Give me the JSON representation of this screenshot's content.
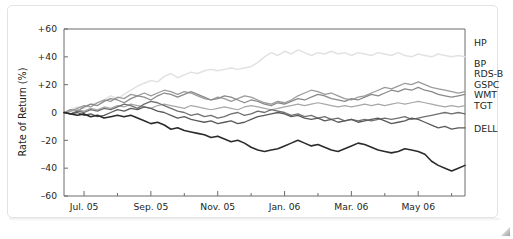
{
  "chart_data": {
    "type": "line",
    "title": "",
    "subtitle": "",
    "xlabel": "",
    "ylabel": "Rate of Return (%)",
    "ylim": [
      -60,
      60
    ],
    "yticks": [
      60,
      40,
      20,
      0,
      -20,
      -40,
      -60
    ],
    "ytick_labels": [
      "+60",
      "+40",
      "+20",
      "0",
      "–20",
      "–40",
      "–60"
    ],
    "xlim": [
      0,
      12
    ],
    "xtick_labels": [
      "Jul. 05",
      "Sep. 05",
      "Nov. 05",
      "Jan. 06",
      "Mar. 06",
      "May 06"
    ],
    "xtick_positions": [
      0.6,
      2.6,
      4.6,
      6.6,
      8.6,
      10.6
    ],
    "minor_tick_positions": [
      1.6,
      3.6,
      5.6,
      7.6,
      9.6,
      11.6
    ],
    "grid": false,
    "legend_position": "right-outside",
    "x": [
      0,
      0.2,
      0.4,
      0.6,
      0.8,
      1,
      1.2,
      1.4,
      1.6,
      1.8,
      2,
      2.2,
      2.4,
      2.6,
      2.8,
      3,
      3.2,
      3.4,
      3.6,
      3.8,
      4,
      4.2,
      4.4,
      4.6,
      4.8,
      5,
      5.2,
      5.4,
      5.6,
      5.8,
      6,
      6.2,
      6.4,
      6.6,
      6.8,
      7,
      7.2,
      7.4,
      7.6,
      7.8,
      8,
      8.2,
      8.4,
      8.6,
      8.8,
      9,
      9.2,
      9.4,
      9.6,
      9.8,
      10,
      10.2,
      10.4,
      10.6,
      10.8,
      11,
      11.2,
      11.4,
      11.6,
      11.8,
      12
    ],
    "series": [
      {
        "name": "HP",
        "color": "#e2e2e2",
        "width": 1.5,
        "values": [
          0,
          2,
          4,
          3,
          6,
          7,
          9,
          12,
          10,
          13,
          16,
          19,
          21,
          23,
          22,
          26,
          28,
          25,
          27,
          29,
          28,
          30,
          31,
          30,
          31,
          32,
          31,
          32,
          33,
          36,
          40,
          43,
          41,
          44,
          42,
          45,
          43,
          41,
          43,
          42,
          44,
          42,
          43,
          41,
          43,
          42,
          41,
          43,
          42,
          41,
          43,
          41,
          40,
          42,
          41,
          40,
          42,
          41,
          40,
          41,
          40
        ]
      },
      {
        "name": "BP",
        "color": "#9b9b9b",
        "width": 1.3,
        "values": [
          0,
          1,
          3,
          5,
          4,
          7,
          9,
          8,
          11,
          10,
          13,
          12,
          14,
          12,
          14,
          16,
          15,
          13,
          15,
          14,
          12,
          10,
          9,
          11,
          10,
          8,
          10,
          12,
          11,
          9,
          7,
          6,
          8,
          7,
          9,
          12,
          14,
          16,
          15,
          13,
          14,
          12,
          10,
          9,
          11,
          12,
          14,
          16,
          18,
          17,
          19,
          21,
          20,
          22,
          20,
          18,
          17,
          16,
          15,
          14,
          15
        ]
      },
      {
        "name": "RDS-B",
        "color": "#8a8a8a",
        "width": 1.3,
        "values": [
          0,
          2,
          1,
          4,
          6,
          5,
          8,
          10,
          9,
          7,
          10,
          12,
          11,
          9,
          12,
          14,
          13,
          11,
          13,
          15,
          13,
          11,
          9,
          10,
          12,
          11,
          9,
          7,
          9,
          8,
          6,
          5,
          7,
          6,
          8,
          10,
          9,
          11,
          13,
          12,
          10,
          9,
          8,
          10,
          9,
          11,
          13,
          12,
          14,
          16,
          15,
          17,
          16,
          18,
          16,
          15,
          13,
          12,
          11,
          12,
          13
        ]
      },
      {
        "name": "GSPC",
        "color": "#a8a8a8",
        "width": 1.2,
        "values": [
          0,
          1,
          2,
          1,
          3,
          2,
          4,
          3,
          5,
          4,
          6,
          5,
          4,
          3,
          5,
          6,
          5,
          4,
          3,
          5,
          4,
          3,
          2,
          3,
          4,
          3,
          2,
          4,
          5,
          4,
          3,
          2,
          3,
          4,
          5,
          6,
          5,
          6,
          7,
          6,
          5,
          4,
          5,
          4,
          5,
          6,
          5,
          6,
          5,
          6,
          7,
          6,
          7,
          8,
          7,
          6,
          5,
          4,
          5,
          4,
          5
        ]
      },
      {
        "name": "WMT",
        "color": "#707070",
        "width": 1.3,
        "values": [
          0,
          -1,
          1,
          0,
          2,
          1,
          3,
          2,
          4,
          6,
          5,
          3,
          6,
          8,
          7,
          5,
          3,
          1,
          0,
          -2,
          -1,
          -3,
          -2,
          -4,
          -3,
          -1,
          0,
          -2,
          -1,
          1,
          0,
          2,
          1,
          0,
          -2,
          -1,
          -3,
          -2,
          -4,
          -3,
          -5,
          -4,
          -6,
          -5,
          -6,
          -5,
          -6,
          -5,
          -4,
          -5,
          -4,
          -3,
          -5,
          -4,
          -3,
          -2,
          -1,
          0,
          -1,
          0,
          -1
        ]
      },
      {
        "name": "TGT",
        "color": "#5a5a5a",
        "width": 1.3,
        "values": [
          0,
          -1,
          0,
          -2,
          -1,
          -3,
          -2,
          0,
          2,
          1,
          3,
          2,
          4,
          3,
          1,
          0,
          -2,
          -4,
          -3,
          -5,
          -6,
          -7,
          -6,
          -8,
          -7,
          -6,
          -8,
          -7,
          -5,
          -3,
          -2,
          -1,
          0,
          -1,
          -3,
          -2,
          -4,
          -5,
          -4,
          -6,
          -5,
          -7,
          -6,
          -5,
          -7,
          -6,
          -5,
          -4,
          -6,
          -8,
          -7,
          -6,
          -4,
          -5,
          -7,
          -9,
          -11,
          -10,
          -12,
          -11,
          -11
        ]
      },
      {
        "name": "DELL",
        "color": "#2b2b2b",
        "width": 1.6,
        "values": [
          0,
          -1,
          -2,
          -1,
          -3,
          -2,
          -4,
          -3,
          -2,
          -3,
          -2,
          -4,
          -6,
          -8,
          -7,
          -9,
          -12,
          -11,
          -13,
          -14,
          -15,
          -16,
          -18,
          -17,
          -19,
          -21,
          -20,
          -22,
          -25,
          -27,
          -28,
          -27,
          -26,
          -24,
          -22,
          -20,
          -22,
          -24,
          -23,
          -25,
          -27,
          -28,
          -26,
          -24,
          -22,
          -23,
          -25,
          -27,
          -28,
          -29,
          -28,
          -26,
          -27,
          -28,
          -30,
          -35,
          -38,
          -40,
          -42,
          -40,
          -38
        ]
      }
    ]
  },
  "legend": {
    "entries": [
      {
        "label": "HP",
        "y": 46
      },
      {
        "label": "BP",
        "y": 67
      },
      {
        "label": "RDS-B",
        "y": 77
      },
      {
        "label": "GSPC",
        "y": 88
      },
      {
        "label": "WMT",
        "y": 98
      },
      {
        "label": "TGT",
        "y": 109
      },
      {
        "label": "DELL",
        "y": 132
      }
    ]
  }
}
